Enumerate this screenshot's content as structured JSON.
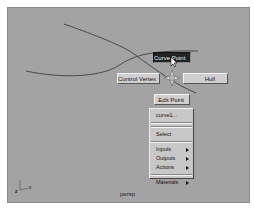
{
  "viewport": {
    "camera_label": "persp",
    "background_color": "#a3a3a3",
    "curve_color": "#4a4a4a"
  },
  "marking_menu": {
    "north": "Curve Point",
    "west": "Control Vertex",
    "east": "Hull",
    "south": "Edit Point",
    "selected": "Curve Point"
  },
  "context_menu": {
    "items": [
      {
        "label": "curve1...",
        "submenu": false
      },
      {
        "label": "Select",
        "submenu": false
      },
      {
        "label": "Inputs",
        "submenu": true
      },
      {
        "label": "Outputs",
        "submenu": true
      },
      {
        "label": "Actions",
        "submenu": true
      },
      {
        "label": "Materials",
        "submenu": true
      }
    ]
  },
  "axis": {
    "x_label": "x",
    "z_label": "z"
  }
}
